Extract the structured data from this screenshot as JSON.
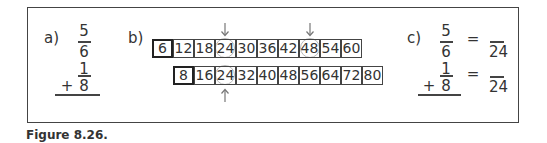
{
  "figure": {
    "caption": "Figure 8.26."
  },
  "part_a": {
    "label": "a)",
    "fraction1": {
      "numerator": "5",
      "denominator": "6"
    },
    "operator": "+",
    "fraction2": {
      "numerator": "1",
      "denominator": "8"
    }
  },
  "part_b": {
    "label": "b)",
    "row1": [
      "6",
      "12",
      "18",
      "24",
      "30",
      "36",
      "42",
      "48",
      "54",
      "60"
    ],
    "row2": [
      "8",
      "16",
      "24",
      "32",
      "40",
      "48",
      "56",
      "64",
      "72",
      "80"
    ],
    "row1_circled": [
      "24",
      "48"
    ],
    "row2_circled": [
      "24"
    ]
  },
  "part_c": {
    "label": "c)",
    "fraction1": {
      "numerator": "5",
      "denominator": "6"
    },
    "operator": "+",
    "fraction2": {
      "numerator": "1",
      "denominator": "8"
    },
    "equals": "=",
    "result1": {
      "numerator": "",
      "denominator": "24"
    },
    "result2": {
      "numerator": "",
      "denominator": "24"
    }
  }
}
